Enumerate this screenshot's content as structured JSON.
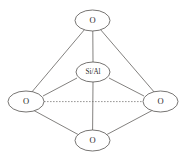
{
  "figure": {
    "type": "diagram",
    "background_color": "#ffffff",
    "line_color": "#5a5754",
    "node_stroke_color": "#54524f",
    "text_color": "#2b2b2b",
    "width": 182,
    "height": 158
  },
  "nodes": [
    {
      "id": "o-top",
      "label": "O",
      "role": "oxygen",
      "cx": 92.5,
      "cy": 20.5,
      "rx": 17.5,
      "ry": 10.5
    },
    {
      "id": "si-al-center",
      "label": "Si/Al",
      "role": "central-cation",
      "cx": 93,
      "cy": 72,
      "rx": 17,
      "ry": 10
    },
    {
      "id": "o-left",
      "label": "O",
      "role": "oxygen",
      "cx": 26,
      "cy": 101.5,
      "rx": 18,
      "ry": 10.5
    },
    {
      "id": "o-right",
      "label": "O",
      "role": "oxygen",
      "cx": 160.5,
      "cy": 101.5,
      "rx": 17.5,
      "ry": 10.5
    },
    {
      "id": "o-bottom",
      "label": "O",
      "role": "oxygen",
      "cx": 92.5,
      "cy": 140.5,
      "rx": 17.5,
      "ry": 10.5
    }
  ],
  "bonds": [
    {
      "id": "bond-top-left",
      "from": "o-top",
      "to": "o-left",
      "style": "solid"
    },
    {
      "id": "bond-top-right",
      "from": "o-top",
      "to": "o-right",
      "style": "solid"
    },
    {
      "id": "bond-top-center",
      "from": "o-top",
      "to": "si-al-center",
      "style": "solid"
    },
    {
      "id": "bond-center-left",
      "from": "si-al-center",
      "to": "o-left",
      "style": "solid"
    },
    {
      "id": "bond-center-right",
      "from": "si-al-center",
      "to": "o-right",
      "style": "solid"
    },
    {
      "id": "bond-center-bottom",
      "from": "si-al-center",
      "to": "o-bottom",
      "style": "solid"
    },
    {
      "id": "bond-left-bottom",
      "from": "o-left",
      "to": "o-bottom",
      "style": "solid"
    },
    {
      "id": "bond-right-bottom",
      "from": "o-right",
      "to": "o-bottom",
      "style": "solid"
    },
    {
      "id": "bond-left-right",
      "from": "o-left",
      "to": "o-right",
      "style": "dashed"
    }
  ]
}
